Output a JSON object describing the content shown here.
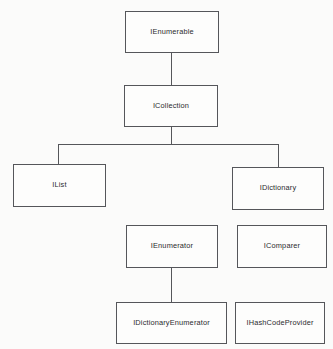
{
  "diagram": {
    "background_color": "#fbfbfa",
    "box_fill_color": "#fdfdfc",
    "line_color": "#55565a",
    "text_color": "#2b2b2d",
    "nodes": [
      {
        "id": "ienumerable",
        "label": "IEnumerable",
        "x": 125,
        "y": 11,
        "w": 94,
        "h": 42
      },
      {
        "id": "icollection",
        "label": "ICollection",
        "x": 124,
        "y": 85,
        "w": 94,
        "h": 42
      },
      {
        "id": "ilist",
        "label": "IList",
        "x": 13,
        "y": 164,
        "w": 93,
        "h": 43
      },
      {
        "id": "idictionary",
        "label": "IDictionary",
        "x": 232,
        "y": 167,
        "w": 92,
        "h": 43
      },
      {
        "id": "ienumerator",
        "label": "IEnumerator",
        "x": 126,
        "y": 225,
        "w": 92,
        "h": 43
      },
      {
        "id": "icomparer",
        "label": "IComparer",
        "x": 237,
        "y": 225,
        "w": 90,
        "h": 43
      },
      {
        "id": "idictionaryenumerator",
        "label": "IDictionaryEnumerator",
        "x": 116,
        "y": 302,
        "w": 111,
        "h": 42
      },
      {
        "id": "ihashcodeprovider",
        "label": "IHashCodeProvider",
        "x": 235,
        "y": 302,
        "w": 90,
        "h": 42
      }
    ],
    "edges": [
      {
        "id": "ienumerable-to-icollection",
        "from": "ienumerable",
        "to": "icollection"
      },
      {
        "id": "icollection-to-ilist",
        "from": "icollection",
        "to": "ilist"
      },
      {
        "id": "icollection-to-idictionary",
        "from": "icollection",
        "to": "idictionary"
      },
      {
        "id": "ienumerator-to-idictionaryenumerator",
        "from": "ienumerator",
        "to": "idictionaryenumerator"
      }
    ]
  }
}
